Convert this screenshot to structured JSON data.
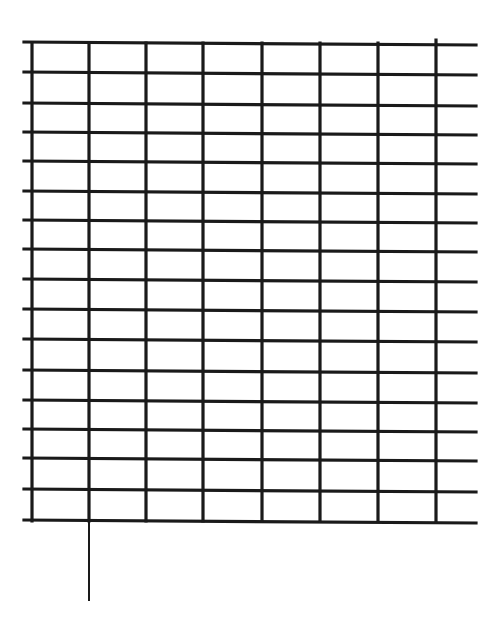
{
  "diagram": {
    "type": "hand-drawn grid",
    "line_color": "#1a1a1a",
    "background": "#ffffff",
    "vertical_lines_x": [
      32,
      89,
      146,
      203,
      262,
      320,
      378,
      436
    ],
    "horizontal_lines_y": [
      42,
      72,
      103,
      132,
      161,
      191,
      220,
      249,
      279,
      309,
      339,
      370,
      400,
      429,
      458,
      489,
      520
    ],
    "grid_left": 24,
    "grid_right": 476,
    "grid_top": 42,
    "grid_bottom": 520,
    "tail_line": {
      "x": 89,
      "y1": 520,
      "y2": 600
    },
    "columns": 7,
    "rows": 16
  }
}
